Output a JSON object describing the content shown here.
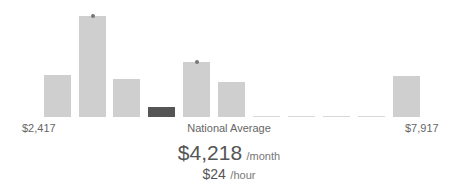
{
  "chart_data": {
    "type": "bar",
    "title": "",
    "xlabel": "",
    "ylabel": "",
    "range_min_label": "$2,417",
    "range_max_label": "$7,917",
    "center_label": "National Average",
    "bars": [
      {
        "x": 44,
        "top": 75,
        "height": 42,
        "highlight": false,
        "marker": false
      },
      {
        "x": 79,
        "top": 16,
        "height": 101,
        "highlight": false,
        "marker": true
      },
      {
        "x": 113,
        "top": 79,
        "height": 38,
        "highlight": false,
        "marker": false
      },
      {
        "x": 148,
        "top": 107,
        "height": 10,
        "highlight": true,
        "marker": false
      },
      {
        "x": 183,
        "top": 62,
        "height": 55,
        "highlight": false,
        "marker": true
      },
      {
        "x": 218,
        "top": 82,
        "height": 35,
        "highlight": false,
        "marker": false
      },
      {
        "x": 253,
        "top": 116,
        "height": 1,
        "highlight": false,
        "marker": false,
        "empty": true
      },
      {
        "x": 288,
        "top": 116,
        "height": 1,
        "highlight": false,
        "marker": false,
        "empty": true
      },
      {
        "x": 323,
        "top": 116,
        "height": 1,
        "highlight": false,
        "marker": false,
        "empty": true
      },
      {
        "x": 358,
        "top": 116,
        "height": 1,
        "highlight": false,
        "marker": false,
        "empty": true
      },
      {
        "x": 393,
        "top": 76,
        "height": 41,
        "highlight": false,
        "marker": false
      }
    ],
    "values_relative": [
      42,
      101,
      38,
      10,
      55,
      35,
      0,
      0,
      0,
      0,
      41
    ],
    "colors": {
      "bar": "#cfcfcf",
      "highlight": "#555555",
      "marker": "#777777"
    }
  },
  "summary": {
    "monthly_value": "$4,218",
    "monthly_unit": "/month",
    "hourly_value": "$24",
    "hourly_unit": "/hour"
  }
}
